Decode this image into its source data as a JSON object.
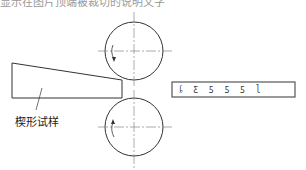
{
  "figure": {
    "top_caption": "显示在图片顶端被裁切的说明文字",
    "specimen_label": "楔形试样",
    "strip_marks": "ᶋ ƹ ƽ ƽ ƽ ɭ",
    "colors": {
      "line": "#333333",
      "center_line": "#888888",
      "background": "#ffffff"
    },
    "rollers": [
      {
        "name": "upper-roller",
        "cx": 134,
        "cy": 51,
        "r": 29,
        "rotation": "counter-clockwise"
      },
      {
        "name": "lower-roller",
        "cx": 134,
        "cy": 127,
        "r": 29,
        "rotation": "clockwise"
      }
    ]
  }
}
